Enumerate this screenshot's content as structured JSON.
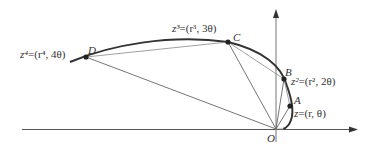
{
  "diagram": {
    "origin_label": "O",
    "points": [
      {
        "id": "A",
        "label": "A",
        "formula_lhs": "z",
        "formula_rhs": "=(r, θ)"
      },
      {
        "id": "B",
        "label": "B",
        "formula_lhs": "z²",
        "formula_rhs": "=(r², 2θ)"
      },
      {
        "id": "C",
        "label": "C",
        "formula_lhs": "z³",
        "formula_rhs": "=(r³, 3θ)"
      },
      {
        "id": "D",
        "label": "D",
        "formula_lhs": "z⁴",
        "formula_rhs": "=(r⁴, 4θ)"
      }
    ],
    "colors": {
      "curve": "#333333",
      "chords": "#666666",
      "axes": "#444444",
      "text": "#333333"
    }
  }
}
